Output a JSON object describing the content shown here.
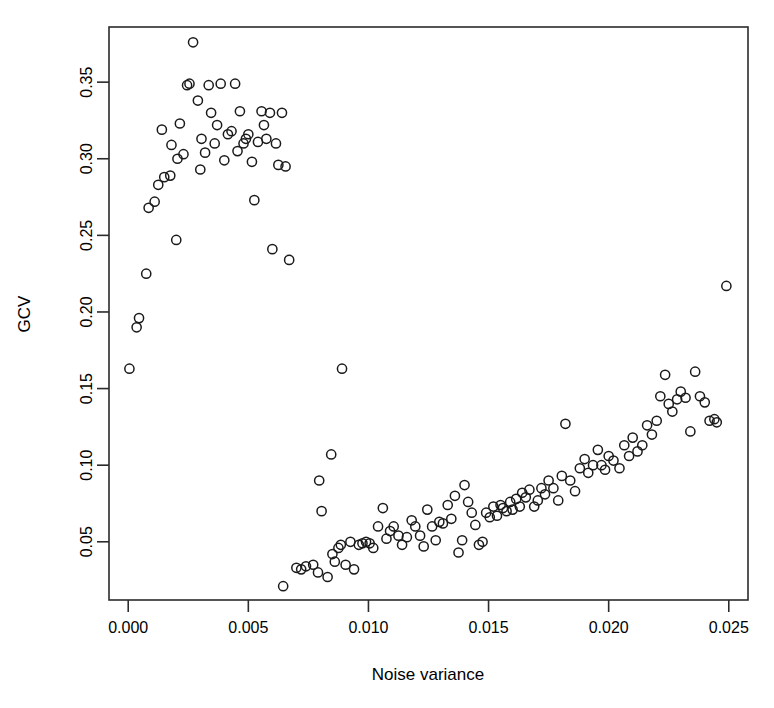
{
  "chart_data": {
    "type": "scatter",
    "title": "",
    "xlabel": "Noise variance",
    "ylabel": "GCV",
    "xlim": [
      -0.0008,
      0.0258
    ],
    "ylim": [
      0.012,
      0.386
    ],
    "grid": false,
    "legend": null,
    "xticks": [
      0.0,
      0.005,
      0.01,
      0.015,
      0.02,
      0.025
    ],
    "xticklabels": [
      "0.000",
      "0.005",
      "0.010",
      "0.015",
      "0.020",
      "0.025"
    ],
    "yticks": [
      0.05,
      0.1,
      0.15,
      0.2,
      0.25,
      0.3,
      0.35
    ],
    "yticklabels": [
      "0.05",
      "0.10",
      "0.15",
      "0.20",
      "0.25",
      "0.30",
      "0.35"
    ],
    "marker": "open-circle",
    "marker_color": "#1a1a1a",
    "n_points": 143,
    "points": [
      [
        5e-05,
        0.163
      ],
      [
        0.00035,
        0.19
      ],
      [
        0.00045,
        0.196
      ],
      [
        0.00075,
        0.225
      ],
      [
        0.00085,
        0.268
      ],
      [
        0.0011,
        0.272
      ],
      [
        0.00125,
        0.283
      ],
      [
        0.0015,
        0.288
      ],
      [
        0.0014,
        0.319
      ],
      [
        0.00175,
        0.289
      ],
      [
        0.0018,
        0.309
      ],
      [
        0.002,
        0.247
      ],
      [
        0.00205,
        0.3
      ],
      [
        0.00215,
        0.323
      ],
      [
        0.0023,
        0.303
      ],
      [
        0.00245,
        0.348
      ],
      [
        0.00255,
        0.349
      ],
      [
        0.0027,
        0.376
      ],
      [
        0.0029,
        0.338
      ],
      [
        0.003,
        0.293
      ],
      [
        0.00305,
        0.313
      ],
      [
        0.0032,
        0.304
      ],
      [
        0.00335,
        0.348
      ],
      [
        0.00345,
        0.33
      ],
      [
        0.0036,
        0.31
      ],
      [
        0.0037,
        0.322
      ],
      [
        0.00385,
        0.349
      ],
      [
        0.004,
        0.299
      ],
      [
        0.00415,
        0.316
      ],
      [
        0.0043,
        0.318
      ],
      [
        0.00445,
        0.349
      ],
      [
        0.00455,
        0.305
      ],
      [
        0.00465,
        0.331
      ],
      [
        0.0048,
        0.31
      ],
      [
        0.0049,
        0.313
      ],
      [
        0.005,
        0.316
      ],
      [
        0.00515,
        0.298
      ],
      [
        0.00525,
        0.273
      ],
      [
        0.0054,
        0.311
      ],
      [
        0.00555,
        0.331
      ],
      [
        0.00565,
        0.322
      ],
      [
        0.00575,
        0.313
      ],
      [
        0.0059,
        0.33
      ],
      [
        0.006,
        0.241
      ],
      [
        0.00615,
        0.31
      ],
      [
        0.00625,
        0.296
      ],
      [
        0.0064,
        0.33
      ],
      [
        0.00655,
        0.295
      ],
      [
        0.0067,
        0.234
      ],
      [
        0.00645,
        0.021
      ],
      [
        0.007,
        0.033
      ],
      [
        0.0072,
        0.032
      ],
      [
        0.0074,
        0.034
      ],
      [
        0.0077,
        0.035
      ],
      [
        0.0079,
        0.03
      ],
      [
        0.00795,
        0.09
      ],
      [
        0.00805,
        0.07
      ],
      [
        0.0083,
        0.027
      ],
      [
        0.00845,
        0.107
      ],
      [
        0.0085,
        0.042
      ],
      [
        0.0086,
        0.037
      ],
      [
        0.00875,
        0.046
      ],
      [
        0.00885,
        0.048
      ],
      [
        0.0089,
        0.163
      ],
      [
        0.00905,
        0.035
      ],
      [
        0.00925,
        0.05
      ],
      [
        0.0094,
        0.032
      ],
      [
        0.0096,
        0.048
      ],
      [
        0.00975,
        0.049
      ],
      [
        0.0099,
        0.05
      ],
      [
        0.01005,
        0.049
      ],
      [
        0.0102,
        0.046
      ],
      [
        0.0104,
        0.06
      ],
      [
        0.0106,
        0.072
      ],
      [
        0.01075,
        0.052
      ],
      [
        0.0109,
        0.057
      ],
      [
        0.01105,
        0.06
      ],
      [
        0.01125,
        0.054
      ],
      [
        0.0114,
        0.048
      ],
      [
        0.0116,
        0.053
      ],
      [
        0.0118,
        0.064
      ],
      [
        0.01195,
        0.06
      ],
      [
        0.01215,
        0.054
      ],
      [
        0.0123,
        0.047
      ],
      [
        0.01245,
        0.071
      ],
      [
        0.01265,
        0.06
      ],
      [
        0.0128,
        0.051
      ],
      [
        0.01295,
        0.063
      ],
      [
        0.0131,
        0.062
      ],
      [
        0.0133,
        0.074
      ],
      [
        0.01345,
        0.065
      ],
      [
        0.0136,
        0.08
      ],
      [
        0.01375,
        0.043
      ],
      [
        0.0139,
        0.051
      ],
      [
        0.014,
        0.087
      ],
      [
        0.01415,
        0.076
      ],
      [
        0.0143,
        0.069
      ],
      [
        0.01445,
        0.061
      ],
      [
        0.0146,
        0.048
      ],
      [
        0.01475,
        0.05
      ],
      [
        0.0149,
        0.069
      ],
      [
        0.01505,
        0.066
      ],
      [
        0.0152,
        0.073
      ],
      [
        0.01535,
        0.067
      ],
      [
        0.0155,
        0.074
      ],
      [
        0.0156,
        0.072
      ],
      [
        0.01575,
        0.07
      ],
      [
        0.0159,
        0.076
      ],
      [
        0.016,
        0.071
      ],
      [
        0.01615,
        0.078
      ],
      [
        0.0163,
        0.073
      ],
      [
        0.0164,
        0.082
      ],
      [
        0.01655,
        0.079
      ],
      [
        0.0167,
        0.084
      ],
      [
        0.0169,
        0.073
      ],
      [
        0.01705,
        0.077
      ],
      [
        0.0172,
        0.085
      ],
      [
        0.01735,
        0.081
      ],
      [
        0.0175,
        0.09
      ],
      [
        0.0177,
        0.085
      ],
      [
        0.0179,
        0.077
      ],
      [
        0.01805,
        0.093
      ],
      [
        0.0182,
        0.127
      ],
      [
        0.0184,
        0.09
      ],
      [
        0.0186,
        0.083
      ],
      [
        0.0188,
        0.098
      ],
      [
        0.019,
        0.104
      ],
      [
        0.01915,
        0.095
      ],
      [
        0.01935,
        0.1
      ],
      [
        0.01955,
        0.11
      ],
      [
        0.0197,
        0.1
      ],
      [
        0.01985,
        0.097
      ],
      [
        0.02,
        0.106
      ],
      [
        0.0202,
        0.103
      ],
      [
        0.02045,
        0.098
      ],
      [
        0.02065,
        0.113
      ],
      [
        0.02085,
        0.106
      ],
      [
        0.021,
        0.118
      ],
      [
        0.0212,
        0.109
      ],
      [
        0.0214,
        0.113
      ],
      [
        0.0216,
        0.126
      ],
      [
        0.0218,
        0.12
      ],
      [
        0.022,
        0.129
      ],
      [
        0.02215,
        0.145
      ],
      [
        0.02235,
        0.159
      ],
      [
        0.0225,
        0.14
      ],
      [
        0.02265,
        0.135
      ],
      [
        0.02285,
        0.143
      ],
      [
        0.023,
        0.148
      ],
      [
        0.0232,
        0.144
      ],
      [
        0.0234,
        0.122
      ],
      [
        0.0236,
        0.161
      ],
      [
        0.0238,
        0.145
      ],
      [
        0.024,
        0.141
      ],
      [
        0.0242,
        0.129
      ],
      [
        0.0244,
        0.13
      ],
      [
        0.0245,
        0.128
      ],
      [
        0.0249,
        0.217
      ]
    ]
  },
  "axes": {
    "x_axis_name": "x-axis",
    "y_axis_name": "y-axis"
  }
}
